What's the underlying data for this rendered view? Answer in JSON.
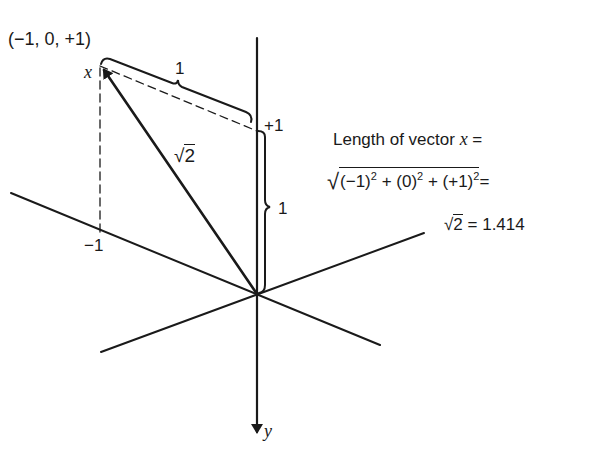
{
  "diagram": {
    "type": "3d-vector-axes",
    "point_label": "(−1, 0, +1)",
    "vector_name": "x",
    "vector_length_label": "√2",
    "axis_y_label": "y",
    "tick_plus_one": "+1",
    "tick_minus_one": "−1",
    "brace_top_label": "1",
    "brace_right_label": "1",
    "colors": {
      "ink": "#1a1a1a",
      "background": "#ffffff"
    }
  },
  "formula": {
    "line1_prefix": "Length of vector ",
    "line1_var": "x",
    "line1_suffix": " =",
    "line2": {
      "radicand_a": "(−1)",
      "radicand_a_exp": "2",
      "plus1": " + ",
      "radicand_b": "(0)",
      "radicand_b_exp": "2",
      "plus2": " + ",
      "radicand_c": "(+1)",
      "radicand_c_exp": "2",
      "equals": "="
    },
    "line3_root": "2",
    "line3_result": " = 1.414"
  }
}
